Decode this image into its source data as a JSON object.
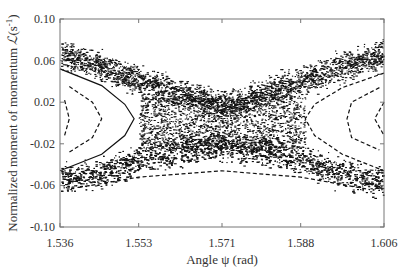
{
  "chart_data": {
    "type": "scatter",
    "title": "",
    "xlabel": "Angle ψ (rad)",
    "ylabel": "Normalized moment of momentum ℒ (s⁻¹)",
    "ylabel_parts": {
      "prefix": "Normalized moment of momentum ",
      "symbol": "ℒ",
      "unit": "(s",
      "sup": "-1",
      "close": ")"
    },
    "xlim": [
      1.536,
      1.606
    ],
    "ylim": [
      -0.1,
      0.1
    ],
    "xticks": [
      "1.536",
      "1.553",
      "1.571",
      "1.588",
      "1.606"
    ],
    "xtick_values": [
      1.536,
      1.553,
      1.571,
      1.588,
      1.606
    ],
    "yticks": [
      "0.10",
      "0.06",
      "0.02",
      "-0.02",
      "-0.06",
      "-0.10"
    ],
    "ytick_values": [
      0.1,
      0.06,
      0.02,
      -0.02,
      -0.06,
      -0.1
    ],
    "grid": false,
    "legend": null,
    "series": [
      {
        "name": "chaotic-band-upper",
        "style": "dense-dots",
        "points": [
          [
            1.536,
            0.066
          ],
          [
            1.545,
            0.055
          ],
          [
            1.553,
            0.04
          ],
          [
            1.562,
            0.028
          ],
          [
            1.571,
            0.016
          ],
          [
            1.58,
            0.028
          ],
          [
            1.588,
            0.04
          ],
          [
            1.597,
            0.055
          ],
          [
            1.606,
            0.066
          ]
        ]
      },
      {
        "name": "chaotic-band-lower",
        "style": "dense-dots",
        "points": [
          [
            1.536,
            -0.055
          ],
          [
            1.545,
            -0.048
          ],
          [
            1.553,
            -0.036
          ],
          [
            1.562,
            -0.026
          ],
          [
            1.571,
            -0.022
          ],
          [
            1.58,
            -0.026
          ],
          [
            1.588,
            -0.036
          ],
          [
            1.597,
            -0.048
          ],
          [
            1.606,
            -0.058
          ]
        ]
      },
      {
        "name": "orbit-left-outer",
        "style": "solid",
        "points": [
          [
            1.536,
            0.052
          ],
          [
            1.545,
            0.036
          ],
          [
            1.55,
            0.018
          ],
          [
            1.552,
            0.004
          ],
          [
            1.55,
            -0.012
          ],
          [
            1.545,
            -0.03
          ],
          [
            1.536,
            -0.046
          ]
        ]
      },
      {
        "name": "orbit-left-inner",
        "style": "dashed",
        "points": [
          [
            1.538,
            0.035
          ],
          [
            1.543,
            0.02
          ],
          [
            1.545,
            0.004
          ],
          [
            1.543,
            -0.014
          ],
          [
            1.538,
            -0.028
          ]
        ]
      },
      {
        "name": "orbit-left-core",
        "style": "dashed",
        "points": [
          [
            1.537,
            0.022
          ],
          [
            1.538,
            0.004
          ],
          [
            1.537,
            -0.012
          ]
        ]
      },
      {
        "name": "orbit-right-outer",
        "style": "dashed",
        "points": [
          [
            1.606,
            0.048
          ],
          [
            1.597,
            0.034
          ],
          [
            1.591,
            0.018
          ],
          [
            1.589,
            0.004
          ],
          [
            1.591,
            -0.012
          ],
          [
            1.597,
            -0.03
          ],
          [
            1.606,
            -0.046
          ]
        ]
      },
      {
        "name": "orbit-right-inner",
        "style": "dashed",
        "points": [
          [
            1.605,
            0.034
          ],
          [
            1.599,
            0.02
          ],
          [
            1.598,
            0.004
          ],
          [
            1.599,
            -0.014
          ],
          [
            1.605,
            -0.026
          ]
        ]
      },
      {
        "name": "orbit-right-core",
        "style": "dashed",
        "points": [
          [
            1.606,
            0.02
          ],
          [
            1.604,
            0.004
          ],
          [
            1.606,
            -0.012
          ]
        ]
      },
      {
        "name": "lower-dashed-arcs",
        "style": "dashed",
        "points": [
          [
            1.54,
            -0.062
          ],
          [
            1.553,
            -0.052
          ],
          [
            1.571,
            -0.046
          ],
          [
            1.588,
            -0.052
          ],
          [
            1.603,
            -0.064
          ]
        ]
      }
    ]
  },
  "colors": {
    "points": "#111111",
    "axis": "#777777",
    "text": "#333333",
    "background": "#ffffff"
  }
}
